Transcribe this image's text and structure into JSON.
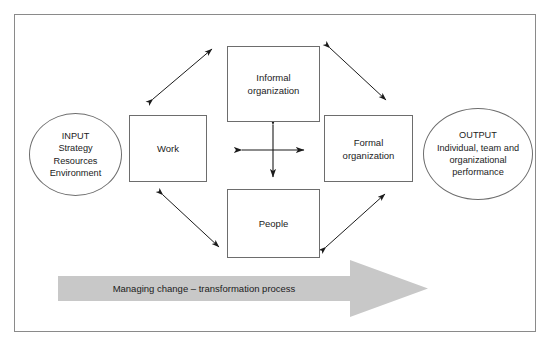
{
  "diagram": {
    "title_visible": false,
    "frame": {
      "border_color": "#8a8a8a",
      "background": "#ffffff"
    },
    "nodes": [
      {
        "id": "informal",
        "label": "Informal\norganization"
      },
      {
        "id": "work",
        "label": "Work"
      },
      {
        "id": "formal",
        "label": "Formal\norganization"
      },
      {
        "id": "people",
        "label": "People"
      }
    ],
    "input": {
      "heading": "INPUT",
      "lines": [
        "Strategy",
        "Resources",
        "Environment"
      ],
      "full_text": "INPUT\nStrategy\nResources\nEnvironment"
    },
    "output": {
      "heading": "OUTPUT",
      "lines": [
        "Individual, team and",
        "organizational",
        "performance"
      ],
      "full_text": "OUTPUT\nIndividual, team and\norganizational\nperformance"
    },
    "banner": {
      "label": "Managing change – transformation process",
      "fill_color": "#c8c8c8"
    },
    "connectors": [
      {
        "id": "work-informal",
        "style": "double-headed-diagonal"
      },
      {
        "id": "informal-formal",
        "style": "double-headed-diagonal"
      },
      {
        "id": "work-people",
        "style": "double-headed-diagonal"
      },
      {
        "id": "people-formal",
        "style": "double-headed-diagonal"
      },
      {
        "id": "center-horizontal",
        "style": "double-headed"
      },
      {
        "id": "center-vertical",
        "style": "double-headed"
      }
    ],
    "colors": {
      "stroke": "#1b1b1b",
      "box_border": "#6d6d6d",
      "frame_border": "#8a8a8a",
      "arrow_fill": "#c8c8c8",
      "text": "#1b1b1b"
    }
  }
}
